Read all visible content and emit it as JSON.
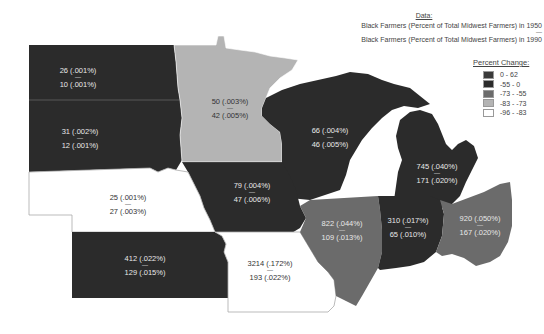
{
  "header": {
    "title": "Data:",
    "line_1950": "Black Farmers (Percent of Total Midwest Farmers) in 1950",
    "separator": "—",
    "line_1990": "Black Farmers (Percent of Total Midwest Farmers) in 1990"
  },
  "legend": {
    "title": "Percent Change:",
    "items": [
      {
        "label": "0 - 62",
        "color": "#3a3a3a"
      },
      {
        "label": "-55 - 0",
        "color": "#2b2b2b"
      },
      {
        "label": "-73 - -55",
        "color": "#6b6b6b"
      },
      {
        "label": "-83 - -73",
        "color": "#b4b4b4"
      },
      {
        "label": "-96 - -83",
        "color": "#ffffff"
      }
    ]
  },
  "states": {
    "north_dakota": {
      "v1950": "26 (.001%)",
      "v1990": "10 (.001%)",
      "color": "#2b2b2b"
    },
    "south_dakota": {
      "v1950": "31 (.002%)",
      "v1990": "12 (.001%)",
      "color": "#2b2b2b"
    },
    "minnesota": {
      "v1950": "50 (.003%)",
      "v1990": "42 (.005%)",
      "color": "#b4b4b4"
    },
    "wisconsin": {
      "v1950": "66 (.004%)",
      "v1990": "46 (.005%)",
      "color": "#2b2b2b"
    },
    "michigan": {
      "v1950": "745 (.040%)",
      "v1990": "171 (.020%)",
      "color": "#2b2b2b"
    },
    "iowa": {
      "v1950": "79 (.004%)",
      "v1990": "47 (.006%)",
      "color": "#2b2b2b"
    },
    "nebraska": {
      "v1950": "25 (.001%)",
      "v1990": "27 (.003%)",
      "color": "#ffffff"
    },
    "kansas": {
      "v1950": "412 (.022%)",
      "v1990": "129 (.015%)",
      "color": "#2b2b2b"
    },
    "missouri": {
      "v1950": "3214 (.172%)",
      "v1990": "193 (.022%)",
      "color": "#ffffff"
    },
    "illinois": {
      "v1950": "822 (.044%)",
      "v1990": "109 (.013%)",
      "color": "#6b6b6b"
    },
    "indiana": {
      "v1950": "310 (.017%)",
      "v1990": "65 (.010%)",
      "color": "#2b2b2b"
    },
    "ohio": {
      "v1950": "920 (.050%)",
      "v1990": "167 (.020%)",
      "color": "#6b6b6b"
    }
  },
  "sep": "—"
}
